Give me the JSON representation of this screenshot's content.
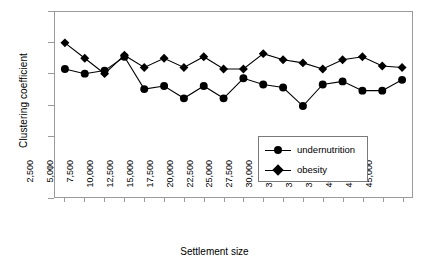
{
  "chart_data": {
    "type": "line",
    "title": "",
    "xlabel": "Settlement size",
    "ylabel": "Clustering coefficient",
    "categories": [
      "2,500",
      "5,000",
      "7,500",
      "10,000",
      "12,500",
      "15,000",
      "17,500",
      "20,000",
      "22,500",
      "25,000",
      "27,500",
      "30,000",
      "32,500",
      "35,000",
      "37,500",
      "40,000",
      "42,500",
      "45,000"
    ],
    "series": [
      {
        "name": "undernutrition",
        "marker": "circle",
        "values": [
          0.415,
          0.4,
          0.41,
          0.455,
          0.35,
          0.36,
          0.32,
          0.36,
          0.32,
          0.385,
          0.365,
          0.355,
          0.295,
          0.365,
          0.375,
          0.345,
          0.345,
          0.38
        ]
      },
      {
        "name": "obesity",
        "marker": "diamond",
        "values": [
          0.5,
          0.45,
          0.4,
          0.46,
          0.42,
          0.45,
          0.42,
          0.455,
          0.415,
          0.415,
          0.465,
          0.445,
          0.435,
          0.415,
          0.445,
          0.455,
          0.425,
          0.42
        ]
      }
    ],
    "ylim": [
      0,
      0.6
    ],
    "yticks": [
      "0",
      "0.1",
      "0.2",
      "0.3",
      "0.4",
      "0.5",
      "0.6"
    ],
    "ytick_values": [
      0,
      0.1,
      0.2,
      0.3,
      0.4,
      0.5,
      0.6
    ],
    "grid": false,
    "legend_position": "inside-lower-right",
    "line_color": "#000000",
    "frame_color": "#9a9a9a"
  },
  "legend": {
    "items": [
      {
        "label": "undernutrition"
      },
      {
        "label": "obesity"
      }
    ]
  }
}
